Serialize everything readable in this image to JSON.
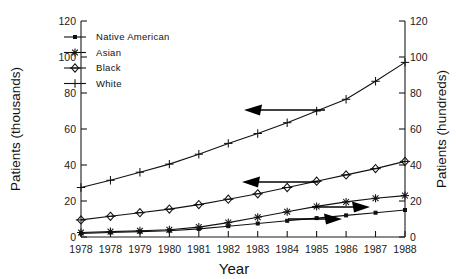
{
  "chart_data": {
    "type": "line",
    "title": "",
    "xlabel": "Year",
    "ylabel": "Patients (thousands)",
    "y2label": "Patients (hundreds)",
    "grid": false,
    "legend_position": "top-left inside axes",
    "x": [
      1978,
      1978,
      1979,
      1980,
      1981,
      1982,
      1983,
      1984,
      1985,
      1986,
      1987,
      1988
    ],
    "xticklabels": [
      "1978",
      "1978",
      "1979",
      "1980",
      "1981",
      "1982",
      "1983",
      "1984",
      "1985",
      "1986",
      "1987",
      "1988"
    ],
    "ylim": [
      0,
      120
    ],
    "yticks": [
      0,
      20,
      40,
      60,
      80,
      100,
      120
    ],
    "yticklabels": [
      "0",
      "20",
      "40",
      "60",
      "80",
      "100",
      "120"
    ],
    "y2lim": [
      0,
      120
    ],
    "y2ticks": [
      0,
      20,
      40,
      60,
      80,
      100,
      120
    ],
    "y2ticklabels": [
      "0",
      "20",
      "40",
      "60",
      "80",
      "100",
      "120"
    ],
    "series": [
      {
        "name": "Native American",
        "marker": "small-filled-square",
        "axis": "right",
        "values": [
          2.0,
          2.5,
          3.0,
          3.5,
          4.5,
          6.0,
          7.5,
          9.0,
          10.5,
          12.0,
          13.5,
          15.0
        ]
      },
      {
        "name": "Asian",
        "marker": "asterisk",
        "axis": "right",
        "values": [
          2.5,
          3.0,
          3.5,
          4.0,
          5.5,
          8.0,
          11.0,
          14.0,
          17.0,
          19.5,
          21.5,
          23.0
        ]
      },
      {
        "name": "Black",
        "marker": "diamond",
        "axis": "left",
        "values": [
          9.5,
          11.5,
          13.5,
          15.5,
          18.0,
          21.0,
          24.0,
          27.5,
          31.0,
          34.5,
          38.0,
          42.0
        ]
      },
      {
        "name": "White",
        "marker": "plus",
        "axis": "left",
        "values": [
          27.5,
          31.5,
          36.0,
          40.5,
          46.0,
          52.0,
          57.5,
          63.5,
          70.0,
          76.5,
          86.5,
          97.0
        ]
      }
    ],
    "annotations": [
      {
        "id": "white-axis-arrow",
        "points_to": "left-axis",
        "direction": "left",
        "series": "White"
      },
      {
        "id": "black-axis-arrow",
        "points_to": "left-axis",
        "direction": "left",
        "series": "Black"
      },
      {
        "id": "asian-axis-arrow",
        "points_to": "right-axis",
        "direction": "right",
        "series": "Asian"
      },
      {
        "id": "native-american-axis-arrow",
        "points_to": "right-axis",
        "direction": "right",
        "series": "Native American"
      }
    ]
  },
  "legend": {
    "entries": [
      {
        "label": "Native American",
        "marker": "small-filled-square"
      },
      {
        "label": "Asian",
        "marker": "asterisk"
      },
      {
        "label": "Black",
        "marker": "diamond"
      },
      {
        "label": "White",
        "marker": "plus"
      }
    ]
  }
}
